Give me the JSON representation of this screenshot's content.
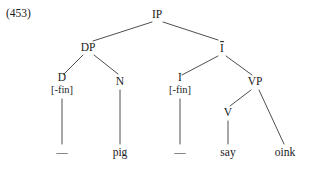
{
  "figure": {
    "example_number": "(453)",
    "background_color": "#ffffff",
    "line_color": "#3a3a3a",
    "text_color": "#1a1a1a"
  },
  "tree": {
    "nodes": {
      "ip": {
        "label": "IP",
        "x": 157,
        "y": 15
      },
      "dp": {
        "label": "DP",
        "x": 88,
        "y": 48
      },
      "ibar": {
        "label": "I",
        "bar": true,
        "x": 222,
        "y": 48
      },
      "d": {
        "label": "D",
        "feature": "[-fin]",
        "x": 62,
        "y": 82
      },
      "n": {
        "label": "N",
        "x": 120,
        "y": 82
      },
      "i": {
        "label": "I",
        "feature": "[-fin]",
        "x": 180,
        "y": 82
      },
      "vp": {
        "label": "VP",
        "x": 255,
        "y": 82
      },
      "v": {
        "label": "V",
        "x": 228,
        "y": 113
      }
    },
    "terminals": {
      "d_null": {
        "text": "—",
        "x": 62,
        "y": 152
      },
      "n_word": {
        "text": "pig",
        "x": 120,
        "y": 152
      },
      "i_null": {
        "text": "—",
        "x": 180,
        "y": 152
      },
      "v_word": {
        "text": "say",
        "x": 228,
        "y": 152
      },
      "vp_word": {
        "text": "oink",
        "x": 285,
        "y": 152
      }
    },
    "edges": [
      {
        "from": "ip",
        "to": "dp",
        "x1": 152,
        "y1": 22,
        "x2": 93,
        "y2": 41
      },
      {
        "from": "ip",
        "to": "ibar",
        "x1": 163,
        "y1": 22,
        "x2": 218,
        "y2": 40
      },
      {
        "from": "dp",
        "to": "d",
        "x1": 83,
        "y1": 55,
        "x2": 64,
        "y2": 74
      },
      {
        "from": "dp",
        "to": "n",
        "x1": 94,
        "y1": 55,
        "x2": 118,
        "y2": 74
      },
      {
        "from": "ibar",
        "to": "i",
        "x1": 218,
        "y1": 56,
        "x2": 182,
        "y2": 75
      },
      {
        "from": "ibar",
        "to": "vp",
        "x1": 226,
        "y1": 56,
        "x2": 252,
        "y2": 75
      },
      {
        "from": "vp",
        "to": "v",
        "x1": 251,
        "y1": 90,
        "x2": 230,
        "y2": 106
      },
      {
        "from": "vp",
        "to": "oink",
        "x1": 259,
        "y1": 90,
        "x2": 284,
        "y2": 144
      },
      {
        "from": "d",
        "to": "d_null",
        "x1": 62,
        "y1": 99,
        "x2": 62,
        "y2": 144
      },
      {
        "from": "n",
        "to": "n_word",
        "x1": 120,
        "y1": 90,
        "x2": 120,
        "y2": 144
      },
      {
        "from": "i",
        "to": "i_null",
        "x1": 180,
        "y1": 99,
        "x2": 180,
        "y2": 144
      },
      {
        "from": "v",
        "to": "v_word",
        "x1": 228,
        "y1": 121,
        "x2": 228,
        "y2": 144
      }
    ]
  }
}
